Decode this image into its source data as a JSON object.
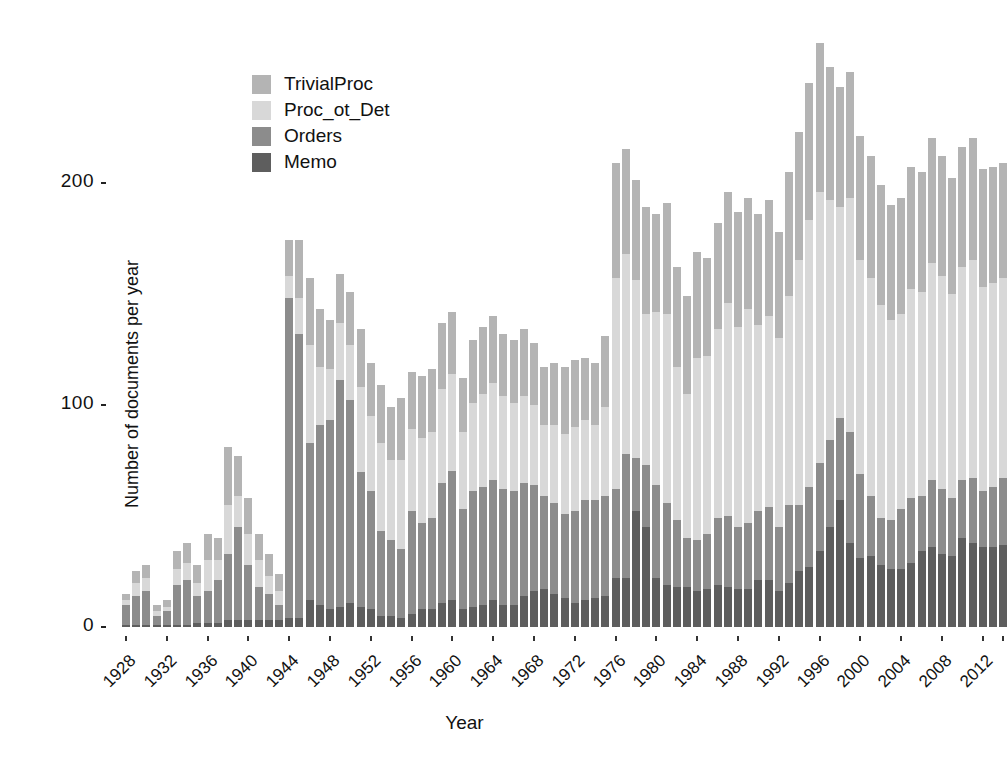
{
  "chart_data": {
    "type": "bar",
    "subtype": "stacked-bar",
    "title": "",
    "xlabel": "Year",
    "ylabel": "Number of documents per year",
    "ylim": [
      0,
      275
    ],
    "yticks": [
      0,
      100,
      200
    ],
    "ytick_labels": [
      "0",
      "100",
      "200"
    ],
    "grid": false,
    "legend_position": "top-left-inside",
    "stack_order_bottom_to_top": [
      "Memo",
      "Orders",
      "Proc_ot_Det",
      "TrivialProc"
    ],
    "legend_order_top_to_bottom": [
      "TrivialProc",
      "Proc_ot_Det",
      "Orders",
      "Memo"
    ],
    "colors": {
      "TrivialProc": "#b4b4b4",
      "Proc_ot_Det": "#d8d8d8",
      "Orders": "#8c8c8c",
      "Memo": "#5e5e5e"
    },
    "categories": [
      1928,
      1929,
      1930,
      1931,
      1932,
      1933,
      1934,
      1935,
      1936,
      1937,
      1938,
      1939,
      1940,
      1941,
      1942,
      1943,
      1944,
      1945,
      1946,
      1947,
      1948,
      1949,
      1950,
      1951,
      1952,
      1953,
      1954,
      1955,
      1956,
      1957,
      1958,
      1959,
      1960,
      1961,
      1962,
      1963,
      1964,
      1965,
      1966,
      1967,
      1968,
      1969,
      1970,
      1971,
      1972,
      1973,
      1974,
      1975,
      1976,
      1977,
      1978,
      1979,
      1980,
      1981,
      1982,
      1983,
      1984,
      1985,
      1986,
      1987,
      1988,
      1989,
      1990,
      1991,
      1992,
      1993,
      1994,
      1995,
      1996,
      1997,
      1998,
      1999,
      2000,
      2001,
      2002,
      2003,
      2004,
      2005,
      2006,
      2007,
      2008,
      2009,
      2010,
      2011,
      2012,
      2013,
      2014
    ],
    "xtick_labels": [
      "1928",
      "1932",
      "1936",
      "1940",
      "1944",
      "1948",
      "1952",
      "1956",
      "1960",
      "1964",
      "1968",
      "1972",
      "1976",
      "1980",
      "1984",
      "1988",
      "1992",
      "1996",
      "2000",
      "2004",
      "2008",
      "2012"
    ],
    "xtick_years": [
      1928,
      1932,
      1936,
      1940,
      1944,
      1948,
      1952,
      1956,
      1960,
      1964,
      1968,
      1972,
      1976,
      1980,
      1984,
      1988,
      1992,
      1996,
      2000,
      2004,
      2008,
      2012
    ],
    "series": [
      {
        "name": "Memo",
        "values": [
          1,
          1,
          1,
          1,
          1,
          1,
          1,
          2,
          2,
          2,
          3,
          3,
          3,
          3,
          3,
          3,
          4,
          4,
          12,
          10,
          8,
          9,
          11,
          9,
          8,
          5,
          5,
          4,
          6,
          8,
          8,
          11,
          12,
          8,
          9,
          10,
          12,
          10,
          10,
          14,
          16,
          17,
          15,
          13,
          11,
          12,
          13,
          14,
          22,
          22,
          52,
          45,
          22,
          19,
          18,
          18,
          16,
          17,
          19,
          18,
          17,
          17,
          21,
          21,
          16,
          20,
          25,
          27,
          34,
          45,
          57,
          38,
          31,
          32,
          28,
          26,
          26,
          29,
          34,
          36,
          33,
          32,
          40,
          38,
          36,
          36,
          37
        ]
      },
      {
        "name": "Orders",
        "values": [
          9,
          13,
          15,
          4,
          6,
          18,
          20,
          12,
          14,
          19,
          30,
          42,
          25,
          15,
          12,
          7,
          144,
          128,
          71,
          81,
          85,
          102,
          91,
          61,
          53,
          38,
          34,
          31,
          46,
          39,
          41,
          54,
          58,
          45,
          52,
          53,
          54,
          52,
          51,
          51,
          48,
          42,
          41,
          38,
          41,
          45,
          44,
          45,
          40,
          56,
          24,
          28,
          42,
          37,
          30,
          22,
          23,
          25,
          30,
          32,
          28,
          30,
          31,
          33,
          29,
          35,
          30,
          36,
          40,
          39,
          37,
          50,
          38,
          27,
          21,
          22,
          27,
          29,
          25,
          30,
          29,
          26,
          26,
          29,
          25,
          27,
          30
        ]
      },
      {
        "name": "Proc_ot_Det",
        "values": [
          2,
          6,
          6,
          2,
          2,
          7,
          8,
          6,
          14,
          9,
          22,
          14,
          14,
          12,
          8,
          6,
          10,
          16,
          44,
          26,
          23,
          26,
          25,
          38,
          34,
          40,
          36,
          40,
          37,
          38,
          39,
          42,
          44,
          35,
          40,
          42,
          44,
          42,
          40,
          39,
          36,
          32,
          35,
          36,
          38,
          36,
          34,
          40,
          95,
          90,
          80,
          68,
          78,
          85,
          69,
          65,
          82,
          80,
          85,
          96,
          90,
          96,
          84,
          86,
          85,
          94,
          110,
          120,
          122,
          108,
          95,
          105,
          96,
          98,
          96,
          90,
          88,
          94,
          92,
          98,
          96,
          92,
          96,
          98,
          92,
          92,
          90
        ]
      },
      {
        "name": "TrivialProc",
        "values": [
          3,
          5,
          6,
          3,
          3,
          8,
          9,
          8,
          12,
          10,
          26,
          18,
          16,
          12,
          10,
          8,
          16,
          26,
          30,
          26,
          22,
          22,
          24,
          26,
          24,
          26,
          24,
          28,
          26,
          28,
          28,
          30,
          28,
          24,
          28,
          30,
          30,
          28,
          28,
          30,
          28,
          26,
          28,
          30,
          30,
          28,
          28,
          32,
          52,
          47,
          45,
          48,
          44,
          50,
          45,
          44,
          48,
          44,
          48,
          50,
          52,
          50,
          50,
          52,
          48,
          56,
          58,
          62,
          67,
          60,
          54,
          57,
          56,
          55,
          54,
          52,
          52,
          55,
          54,
          56,
          54,
          52,
          54,
          55,
          53,
          52,
          52
        ]
      }
    ]
  },
  "legend": {
    "items": [
      {
        "label": "TrivialProc",
        "color": "#b4b4b4"
      },
      {
        "label": "Proc_ot_Det",
        "color": "#d8d8d8"
      },
      {
        "label": "Orders",
        "color": "#8c8c8c"
      },
      {
        "label": "Memo",
        "color": "#5e5e5e"
      }
    ]
  },
  "axes": {
    "y_title": "Number of documents per year",
    "x_title": "Year"
  }
}
